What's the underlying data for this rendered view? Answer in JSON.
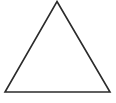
{
  "figure": {
    "shape": "triangle",
    "kind": "equilateral-triangle-outline",
    "vertices": {
      "apex": [
        57,
        1.5
      ],
      "bottom_left": [
        5,
        92
      ],
      "bottom_right": [
        110,
        92
      ]
    },
    "stroke_color": "#2b2b2b",
    "stroke_width": 1.6,
    "fill_color": "#ffffff",
    "background_color": "#ffffff"
  }
}
